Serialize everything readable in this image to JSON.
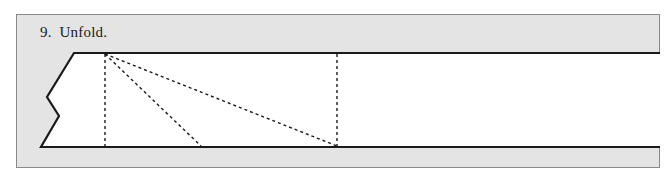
{
  "step": {
    "number": "9.",
    "instruction": "Unfold.",
    "label": "9.  Unfold."
  },
  "diagram": {
    "panel_color": "#e4e4e4",
    "paper_color": "#ffffff",
    "outline_color": "#1a1a1a",
    "crease_color": "#1a1a1a",
    "lines": [
      {
        "name": "vertical-crease-left",
        "style": "dashed"
      },
      {
        "name": "diagonal-crease-short",
        "style": "dashed"
      },
      {
        "name": "diagonal-crease-long",
        "style": "dashed"
      },
      {
        "name": "vertical-crease-right",
        "style": "dashed"
      }
    ]
  }
}
